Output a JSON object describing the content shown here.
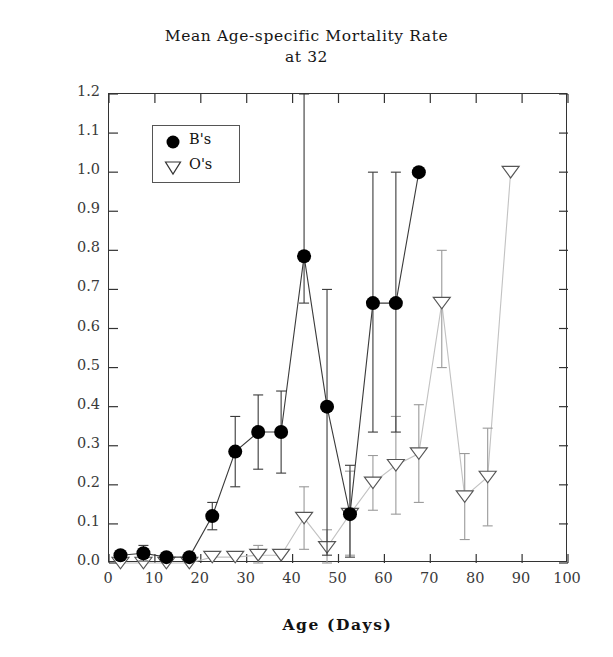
{
  "title": {
    "line1": "Mean Age-specific Mortality Rate",
    "line2": "at 32"
  },
  "axes": {
    "xlabel": "Age (Days)",
    "ylabel": "Mortality rate (Qx)",
    "xticks": [
      "0",
      "10",
      "20",
      "30",
      "40",
      "50",
      "60",
      "70",
      "80",
      "90",
      "100"
    ],
    "yticks": [
      "0.0",
      "0.1",
      "0.2",
      "0.3",
      "0.4",
      "0.5",
      "0.6",
      "0.7",
      "0.8",
      "0.9",
      "1.0",
      "1.1",
      "1.2"
    ]
  },
  "legend": {
    "items": [
      {
        "label": "B's",
        "marker": "filled-circle"
      },
      {
        "label": "O's",
        "marker": "open-triangle-down"
      }
    ]
  },
  "chart_data": {
    "type": "line",
    "title": "Mean Age-specific Mortality Rate at 32",
    "xlabel": "Age (Days)",
    "ylabel": "Mortality rate (Qx)",
    "xlim": [
      0,
      100
    ],
    "ylim": [
      0.0,
      1.2
    ],
    "xtick_step": 10,
    "ytick_step": 0.1,
    "grid": false,
    "legend_position": "upper-left-inside",
    "series": [
      {
        "name": "B's",
        "marker": "filled-circle",
        "color": "#000000",
        "x": [
          2.5,
          7.5,
          12.5,
          17.5,
          22.5,
          27.5,
          32.5,
          37.5,
          42.5,
          47.5,
          52.5,
          57.5,
          62.5,
          67.5
        ],
        "y": [
          0.02,
          0.025,
          0.015,
          0.015,
          0.12,
          0.285,
          0.335,
          0.335,
          0.785,
          0.4,
          0.125,
          0.665,
          0.665,
          1.0
        ],
        "yerr_low": [
          0.02,
          0.005,
          0.015,
          0.015,
          0.085,
          0.195,
          0.24,
          0.23,
          0.665,
          0.02,
          0.015,
          0.335,
          0.335,
          1.0
        ],
        "yerr_high": [
          0.02,
          0.045,
          0.015,
          0.015,
          0.155,
          0.375,
          0.43,
          0.44,
          1.2,
          0.7,
          0.25,
          1.0,
          1.0,
          1.0
        ]
      },
      {
        "name": "O's",
        "marker": "open-triangle-down",
        "color": "#000000",
        "x": [
          2.5,
          7.5,
          12.5,
          17.5,
          22.5,
          27.5,
          32.5,
          37.5,
          42.5,
          47.5,
          52.5,
          57.5,
          62.5,
          67.5,
          72.5,
          77.5,
          82.5,
          87.5
        ],
        "y": [
          0.0,
          0.0,
          0.0,
          0.0,
          0.015,
          0.015,
          0.02,
          0.02,
          0.115,
          0.04,
          0.125,
          0.205,
          0.25,
          0.28,
          0.665,
          0.17,
          0.22,
          1.0
        ],
        "yerr_low": [
          0.0,
          0.0,
          0.0,
          0.0,
          0.015,
          0.015,
          0.0,
          0.02,
          0.035,
          0.0,
          0.02,
          0.135,
          0.125,
          0.155,
          0.5,
          0.06,
          0.095,
          1.0
        ],
        "yerr_high": [
          0.0,
          0.0,
          0.0,
          0.0,
          0.015,
          0.015,
          0.045,
          0.02,
          0.195,
          0.085,
          0.235,
          0.275,
          0.375,
          0.405,
          0.8,
          0.28,
          0.345,
          1.0
        ]
      }
    ]
  }
}
